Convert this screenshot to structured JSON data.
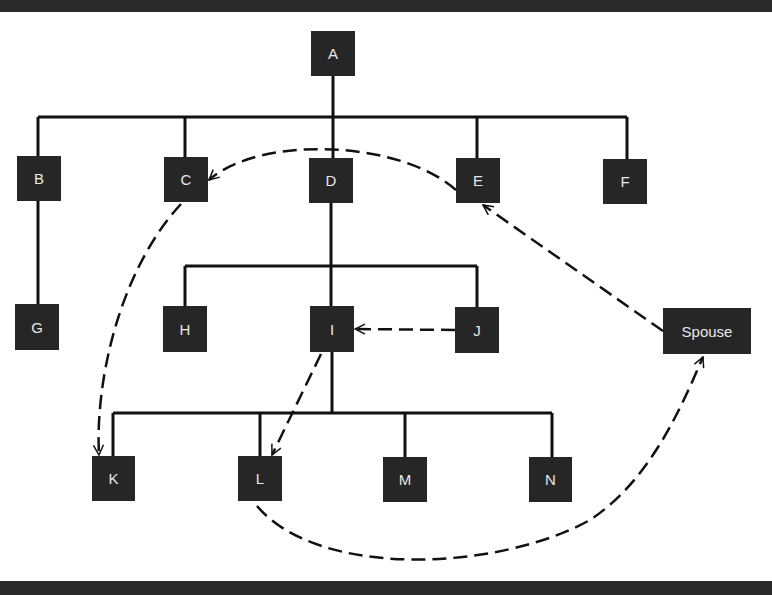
{
  "colors": {
    "node_fill": "#262626",
    "node_text": "#e8e8e8",
    "line": "#111111",
    "frame_bar": "#2b2b2b",
    "background": "#ffffff"
  },
  "nodes": [
    {
      "id": "A",
      "label": "A",
      "x": 311,
      "y": 31,
      "w": 44,
      "h": 45
    },
    {
      "id": "B",
      "label": "B",
      "x": 17,
      "y": 156,
      "w": 44,
      "h": 45
    },
    {
      "id": "C",
      "label": "C",
      "x": 164,
      "y": 157,
      "w": 44,
      "h": 45
    },
    {
      "id": "D",
      "label": "D",
      "x": 309,
      "y": 158,
      "w": 44,
      "h": 45
    },
    {
      "id": "E",
      "label": "E",
      "x": 456,
      "y": 158,
      "w": 44,
      "h": 45
    },
    {
      "id": "F",
      "label": "F",
      "x": 603,
      "y": 159,
      "w": 44,
      "h": 45
    },
    {
      "id": "G",
      "label": "G",
      "x": 15,
      "y": 304,
      "w": 44,
      "h": 46
    },
    {
      "id": "H",
      "label": "H",
      "x": 163,
      "y": 306,
      "w": 44,
      "h": 46
    },
    {
      "id": "I",
      "label": "I",
      "x": 310,
      "y": 306,
      "w": 44,
      "h": 46
    },
    {
      "id": "J",
      "label": "J",
      "x": 455,
      "y": 307,
      "w": 44,
      "h": 46
    },
    {
      "id": "Spouse",
      "label": "Spouse",
      "x": 663,
      "y": 308,
      "w": 88,
      "h": 46
    },
    {
      "id": "K",
      "label": "K",
      "x": 92,
      "y": 456,
      "w": 43,
      "h": 45
    },
    {
      "id": "L",
      "label": "L",
      "x": 238,
      "y": 456,
      "w": 44,
      "h": 45
    },
    {
      "id": "M",
      "label": "M",
      "x": 383,
      "y": 457,
      "w": 44,
      "h": 45
    },
    {
      "id": "N",
      "label": "N",
      "x": 529,
      "y": 457,
      "w": 43,
      "h": 45
    }
  ],
  "solid_edges": [
    {
      "from": "A",
      "to": [
        "B",
        "C",
        "D",
        "E",
        "F"
      ]
    },
    {
      "from": "B",
      "to": [
        "G"
      ]
    },
    {
      "from": "D",
      "to": [
        "H",
        "I",
        "J"
      ]
    },
    {
      "from": "I",
      "to": [
        "K",
        "L",
        "M",
        "N"
      ]
    }
  ],
  "dashed_arrows": [
    {
      "from": "Spouse",
      "to": "E"
    },
    {
      "from": "E",
      "to": "C"
    },
    {
      "from": "C",
      "to": "K"
    },
    {
      "from": "J",
      "to": "I"
    },
    {
      "from": "I",
      "to": "L"
    },
    {
      "from": "L",
      "to": "Spouse"
    }
  ]
}
